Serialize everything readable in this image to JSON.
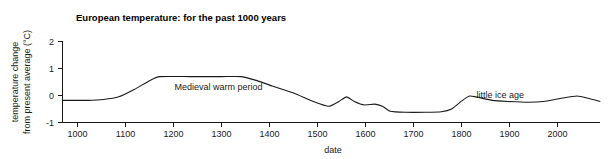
{
  "chart_data": {
    "type": "line",
    "title": "European temperature: for the past 1000 years",
    "xlabel": "date",
    "ylabel_line1": "temperature change",
    "ylabel_line2": "from present average (°C)",
    "xlim": [
      950,
      2000
    ],
    "ylim": [
      -1,
      2
    ],
    "xticks": [
      1000,
      1100,
      1200,
      1300,
      1400,
      1500,
      1600,
      1700,
      1800,
      1900,
      2000
    ],
    "xtick_labels": [
      "1000",
      "1100",
      "1200",
      "1300",
      "1400",
      "1500",
      "1600",
      "1700",
      "1800",
      "1900",
      "2000"
    ],
    "yticks": [
      -1,
      0,
      1,
      2
    ],
    "ytick_labels": [
      "-1",
      "0",
      "1",
      "2"
    ],
    "grid": false,
    "legend": "none",
    "line_color": "#1a1a1a",
    "series": [
      {
        "name": "temperature change from present average",
        "x": [
          950,
          1000,
          1030,
          1060,
          1090,
          1120,
          1140,
          1200,
          1260,
          1300,
          1330,
          1360,
          1400,
          1440,
          1470,
          1490,
          1505,
          1520,
          1540,
          1560,
          1575,
          1590,
          1620,
          1660,
          1690,
          1710,
          1730,
          1745,
          1760,
          1790,
          1820,
          1860,
          1890,
          1920,
          1955,
          1980,
          2000
        ],
        "y": [
          -0.18,
          -0.18,
          -0.15,
          -0.05,
          0.22,
          0.55,
          0.7,
          0.7,
          0.7,
          0.7,
          0.55,
          0.35,
          0.1,
          -0.22,
          -0.4,
          -0.22,
          -0.05,
          -0.22,
          -0.35,
          -0.32,
          -0.4,
          -0.58,
          -0.62,
          -0.62,
          -0.6,
          -0.5,
          -0.2,
          -0.02,
          -0.06,
          -0.18,
          -0.22,
          -0.25,
          -0.22,
          -0.12,
          -0.02,
          -0.12,
          -0.22
        ]
      }
    ],
    "annotations": [
      {
        "text": "Medieval warm period",
        "x": 1255,
        "y": 0.32
      },
      {
        "text": "little ice age",
        "x": 1805,
        "y": 0.03
      }
    ]
  }
}
